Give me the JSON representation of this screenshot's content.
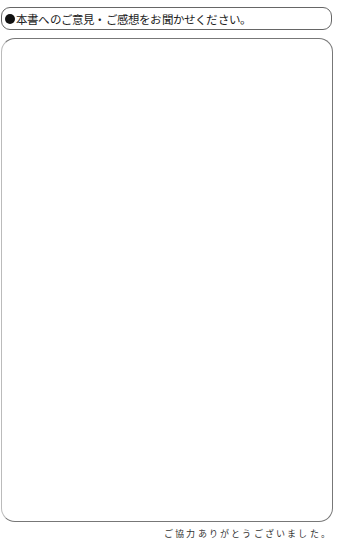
{
  "form": {
    "heading": "本書へのご意見・ご感想をお聞かせください。",
    "comment_area": "",
    "closing": "ご協力ありがとうございました。"
  }
}
